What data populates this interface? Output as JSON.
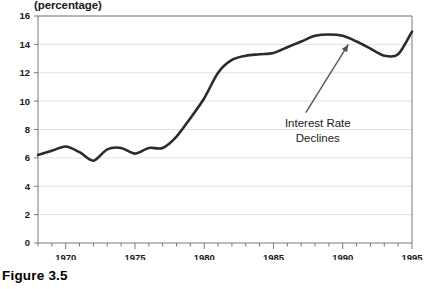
{
  "caption": "Figure 3.5",
  "unit_label": "(percentage)",
  "annotation": {
    "line1": "Interest Rate",
    "line2": "Declines"
  },
  "colors": {
    "line": "#2b2b2b",
    "grid": "#e2e2e2",
    "axis": "#7a7a7a",
    "text": "#1a1a1a",
    "background": "#ffffff",
    "annotation_arrow": "#555555"
  },
  "chart_data": {
    "type": "line",
    "title": "",
    "subtitle": "",
    "xlabel": "",
    "ylabel": "(percentage)",
    "xlim": [
      1968,
      1995
    ],
    "ylim": [
      0,
      16
    ],
    "ytick_step": 2,
    "yticks": [
      0,
      2,
      4,
      6,
      8,
      10,
      12,
      14,
      16
    ],
    "ytick_labels": [
      "0",
      "2",
      "4",
      "6",
      "8",
      "10",
      "12",
      "14",
      "16"
    ],
    "xticks_major": [
      1970,
      1975,
      1980,
      1985,
      1990,
      1995
    ],
    "xtick_labels": [
      "1970",
      "1975",
      "1980",
      "1985",
      "1990",
      "1995"
    ],
    "xticks_minor_step": 1,
    "grid": "horizontal",
    "legend": "none",
    "annotations": [
      {
        "text": "Interest Rate Declines",
        "x": 1988.2,
        "y": 8.9,
        "arrow_to_x": 1990.4,
        "arrow_to_y": 14.0
      }
    ],
    "series": [
      {
        "name": "Interest Rate",
        "x": [
          1968,
          1969,
          1970,
          1971,
          1972,
          1973,
          1974,
          1975,
          1976,
          1977,
          1978,
          1979,
          1980,
          1981,
          1982,
          1983,
          1984,
          1985,
          1986,
          1987,
          1988,
          1989,
          1990,
          1991,
          1992,
          1993,
          1994,
          1995
        ],
        "values": [
          6.2,
          6.5,
          6.8,
          6.4,
          5.8,
          6.6,
          6.7,
          6.3,
          6.7,
          6.7,
          7.5,
          8.8,
          10.2,
          12.0,
          12.9,
          13.2,
          13.3,
          13.4,
          13.8,
          14.2,
          14.6,
          14.7,
          14.6,
          14.2,
          13.7,
          13.2,
          13.3,
          14.9
        ]
      }
    ]
  }
}
